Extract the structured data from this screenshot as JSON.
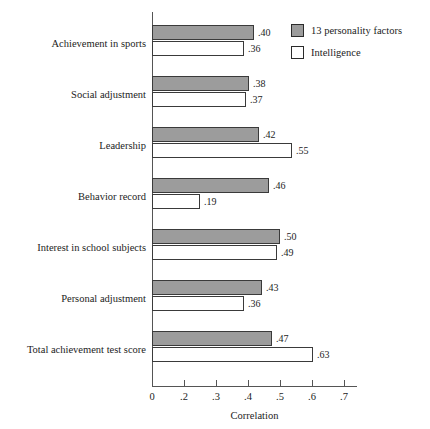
{
  "chart_data": {
    "type": "bar",
    "orientation": "horizontal",
    "title": "",
    "xlabel": "Correlation",
    "ylabel": "",
    "grid": false,
    "xlim": [
      0,
      0.7
    ],
    "xticks": [
      "0",
      ".2",
      ".3",
      ".4",
      ".5",
      ".6",
      ".7"
    ],
    "xtick_values": [
      0,
      0.2,
      0.3,
      0.4,
      0.5,
      0.6,
      0.7
    ],
    "legend_position": "top-right",
    "categories": [
      "Achievement in sports",
      "Social adjustment",
      "Leadership",
      "Behavior record",
      "Interest in school subjects",
      "Personal adjustment",
      "Total achievement test score"
    ],
    "series": [
      {
        "name": "13 personality factors",
        "color": "#9c9c9c",
        "values": [
          0.4,
          0.38,
          0.42,
          0.46,
          0.5,
          0.43,
          0.47
        ],
        "labels": [
          ".40",
          ".38",
          ".42",
          ".46",
          ".50",
          ".43",
          ".47"
        ]
      },
      {
        "name": "Intelligence",
        "color": "#ffffff",
        "values": [
          0.36,
          0.37,
          0.55,
          0.19,
          0.49,
          0.36,
          0.63
        ],
        "labels": [
          ".36",
          ".37",
          ".55",
          ".19",
          ".49",
          ".36",
          ".63"
        ]
      }
    ]
  },
  "legend": {
    "items": [
      {
        "label": "13 personality factors",
        "swatch": "filled-gray"
      },
      {
        "label": "Intelligence",
        "swatch": "outlined-white"
      }
    ]
  },
  "axis": {
    "x_title": "Correlation"
  }
}
